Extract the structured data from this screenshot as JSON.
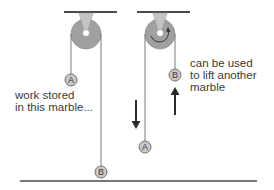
{
  "diagram": {
    "title": "",
    "colors": {
      "line": "#4a4a4a",
      "pulley": "#a0a0a0",
      "mount": "#c4c4c4",
      "marble": "#c8c8c8",
      "text": "#3a3a3a"
    },
    "left_scene": {
      "marble_top": {
        "label": "A"
      },
      "marble_bottom": {
        "label": "B"
      },
      "caption_line1": "work stored",
      "caption_line2": "in this marble..."
    },
    "right_scene": {
      "marble_top": {
        "label": "B"
      },
      "marble_bottom": {
        "label": "A"
      },
      "caption_line1": "can be used",
      "caption_line2": "to lift another",
      "caption_line3": "marble",
      "down_arrow": "down-arrow",
      "up_arrow": "up-arrow"
    }
  }
}
